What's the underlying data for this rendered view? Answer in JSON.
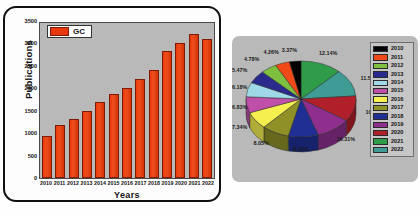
{
  "bar_panel": {
    "legend_label": "GC",
    "ylabel": "Publications",
    "xlabel": "Years"
  },
  "chart_data": [
    {
      "type": "bar",
      "title": "",
      "xlabel": "Years",
      "ylabel": "Publications",
      "legend": [
        "GC"
      ],
      "legend_position": "top-left",
      "grid": false,
      "ylim": [
        0,
        3500
      ],
      "yticks": [
        3500,
        3000,
        2500,
        2000,
        1500,
        1000,
        500,
        0
      ],
      "ytick_labels": [
        "3500",
        "3000",
        "2500",
        "2000",
        "1500",
        "1000",
        "500",
        "0"
      ],
      "categories": [
        "2010",
        "2011",
        "2012",
        "2013",
        "2014",
        "2015",
        "2016",
        "2017",
        "2018",
        "2019",
        "2020",
        "2021",
        "2022"
      ],
      "series": [
        {
          "name": "GC",
          "color": "#e8380d",
          "values": [
            940,
            1190,
            1330,
            1510,
            1710,
            1900,
            2040,
            2230,
            2430,
            2860,
            3040,
            3260,
            3140
          ]
        }
      ]
    },
    {
      "type": "pie",
      "title": "",
      "three_d": true,
      "legend_position": "right",
      "labels": [
        "2010",
        "2011",
        "2012",
        "2013",
        "2014",
        "2015",
        "2016",
        "2017",
        "2018",
        "2019",
        "2020",
        "2021",
        "2022"
      ],
      "values": [
        3.37,
        4.26,
        4.78,
        5.47,
        6.18,
        6.83,
        7.34,
        8.05,
        8.79,
        10.31,
        10.91,
        12.14,
        11.57
      ],
      "value_labels": [
        "3.37%",
        "4.26%",
        "4.78%",
        "5.47%",
        "6.18%",
        "6.83%",
        "7.34%",
        "8.05%",
        "8.79%",
        "10.31%",
        "10.91%",
        "12.14%",
        "11.57%"
      ],
      "colors": [
        "#000000",
        "#ef4a18",
        "#7fbf3f",
        "#2a2a8c",
        "#9fd8e6",
        "#bf4fa8",
        "#f5ef4f",
        "#8f9126",
        "#1f2f94",
        "#8e2f8e",
        "#b01f2a",
        "#2f9c4a",
        "#3f9c94"
      ]
    }
  ],
  "pie_legend": {
    "items": [
      {
        "year": "2010",
        "color": "#000000"
      },
      {
        "year": "2011",
        "color": "#ef4a18"
      },
      {
        "year": "2012",
        "color": "#7fbf3f"
      },
      {
        "year": "2013",
        "color": "#2a2a8c"
      },
      {
        "year": "2014",
        "color": "#9fd8e6"
      },
      {
        "year": "2015",
        "color": "#bf4fa8"
      },
      {
        "year": "2016",
        "color": "#f5ef4f"
      },
      {
        "year": "2017",
        "color": "#8f9126"
      },
      {
        "year": "2018",
        "color": "#1f2f94"
      },
      {
        "year": "2019",
        "color": "#8e2f8e"
      },
      {
        "year": "2020",
        "color": "#b01f2a"
      },
      {
        "year": "2021",
        "color": "#2f9c4a"
      },
      {
        "year": "2022",
        "color": "#3f9c94"
      }
    ]
  },
  "colors": {
    "bar_red": "#e8380d",
    "plot_gray": "#b9b9b9",
    "panel_border": "#111111"
  }
}
